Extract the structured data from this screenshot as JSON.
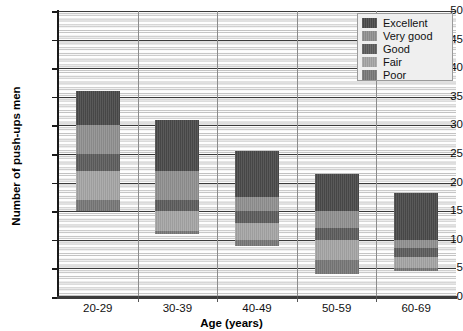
{
  "chart_data": {
    "type": "bar",
    "subtype": "stacked-range",
    "title": "",
    "xlabel": "Age (years)",
    "ylabel": "Number of push-ups men",
    "categories": [
      "20-29",
      "30-39",
      "40-49",
      "50-59",
      "60-69"
    ],
    "ylim": [
      0,
      50
    ],
    "yticks": [
      0,
      5,
      10,
      15,
      20,
      25,
      30,
      35,
      40,
      45,
      50
    ],
    "ytick_labels": [
      "0",
      "5",
      "10",
      "15",
      "20",
      "25",
      "30",
      "35",
      "40",
      "45",
      "50"
    ],
    "grid": true,
    "grid_minor_step": 1,
    "grid_major_step": 5,
    "legend_position": "top-right",
    "legend": [
      "Excellent",
      "Very good",
      "Good",
      "Fair",
      "Poor"
    ],
    "series": [
      {
        "name": "Excellent",
        "color": "#4a4a4a",
        "ranges": [
          {
            "category": "20-29",
            "low": 30.0,
            "high": 36.0
          },
          {
            "category": "30-39",
            "low": 22.0,
            "high": 31.0
          },
          {
            "category": "40-49",
            "low": 17.5,
            "high": 25.5
          },
          {
            "category": "50-59",
            "low": 15.0,
            "high": 21.5
          },
          {
            "category": "60-69",
            "low": 10.0,
            "high": 18.2
          }
        ]
      },
      {
        "name": "Very good",
        "color": "#909090",
        "ranges": [
          {
            "category": "20-29",
            "low": 25.0,
            "high": 30.0
          },
          {
            "category": "30-39",
            "low": 17.0,
            "high": 22.0
          },
          {
            "category": "40-49",
            "low": 15.0,
            "high": 17.5
          },
          {
            "category": "50-59",
            "low": 12.0,
            "high": 15.0
          },
          {
            "category": "60-69",
            "low": 8.5,
            "high": 10.0
          }
        ]
      },
      {
        "name": "Good",
        "color": "#5d5d5d",
        "ranges": [
          {
            "category": "20-29",
            "low": 22.0,
            "high": 25.0
          },
          {
            "category": "30-39",
            "low": 15.0,
            "high": 17.0
          },
          {
            "category": "40-49",
            "low": 13.0,
            "high": 15.0
          },
          {
            "category": "50-59",
            "low": 10.0,
            "high": 12.0
          },
          {
            "category": "60-69",
            "low": 7.0,
            "high": 8.5
          }
        ]
      },
      {
        "name": "Fair",
        "color": "#a5a5a5",
        "ranges": [
          {
            "category": "20-29",
            "low": 17.0,
            "high": 22.0
          },
          {
            "category": "30-39",
            "low": 11.5,
            "high": 15.0
          },
          {
            "category": "40-49",
            "low": 10.0,
            "high": 13.0
          },
          {
            "category": "50-59",
            "low": 6.5,
            "high": 10.0
          },
          {
            "category": "60-69",
            "low": 5.0,
            "high": 7.0
          }
        ]
      },
      {
        "name": "Poor",
        "color": "#787878",
        "ranges": [
          {
            "category": "20-29",
            "low": 15.0,
            "high": 17.0
          },
          {
            "category": "30-39",
            "low": 11.0,
            "high": 11.5
          },
          {
            "category": "40-49",
            "low": 9.0,
            "high": 10.0
          },
          {
            "category": "50-59",
            "low": 4.0,
            "high": 6.5
          },
          {
            "category": "60-69",
            "low": 4.5,
            "high": 5.0
          }
        ]
      }
    ]
  }
}
